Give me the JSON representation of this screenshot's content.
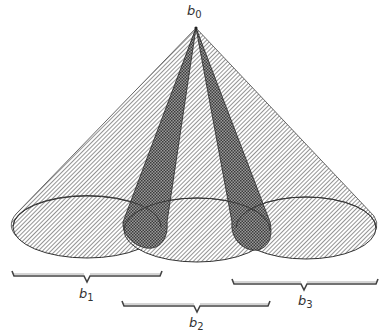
{
  "diagram": {
    "apex": {
      "label": "b",
      "sub": "0"
    },
    "cones": [
      {
        "name": "cone-b1",
        "ellipse": {
          "cx": 87,
          "cy": 227,
          "rx": 74,
          "ry": 31
        }
      },
      {
        "name": "cone-b2",
        "ellipse": {
          "cx": 197,
          "cy": 230,
          "rx": 73,
          "ry": 32
        }
      },
      {
        "name": "cone-b3",
        "ellipse": {
          "cx": 306,
          "cy": 228,
          "rx": 70,
          "ry": 31
        }
      }
    ],
    "braces": [
      {
        "label": "b",
        "sub": "1"
      },
      {
        "label": "b",
        "sub": "2"
      },
      {
        "label": "b",
        "sub": "3"
      }
    ],
    "colors": {
      "hatch": "#555555",
      "outline": "#333333",
      "overlap": "#444444"
    }
  }
}
